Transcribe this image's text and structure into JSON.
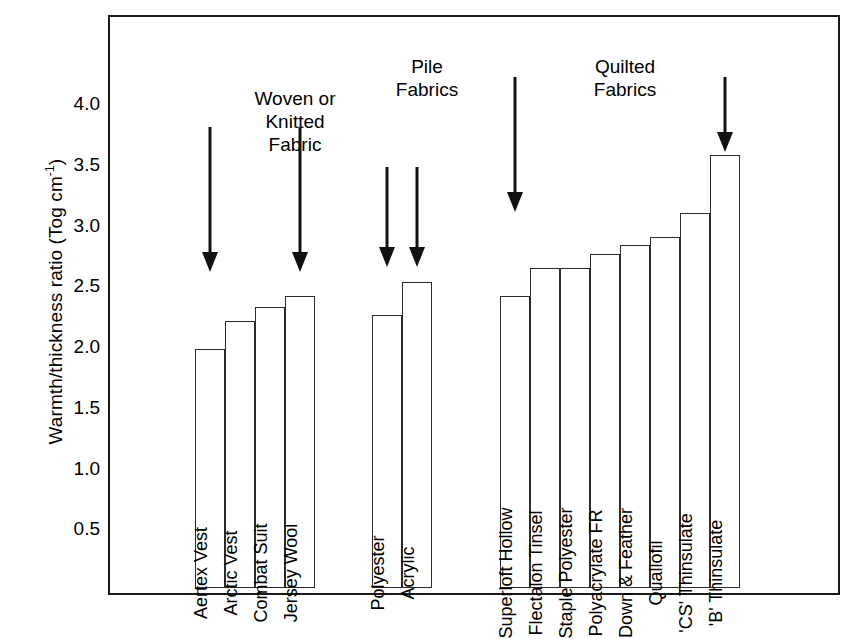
{
  "chart_data": {
    "type": "bar",
    "title": "",
    "xlabel": "",
    "ylabel": "Warmth/thickness ratio (Tog cm",
    "ylabel_sup": "-1",
    "ylabel_tail": ")",
    "ylim": [
      0,
      4.25
    ],
    "grid": false,
    "legend": "none",
    "ticks": [
      "4.0",
      "3.5",
      "3.0",
      "2.5",
      "2.0",
      "1.5",
      "1.0",
      "0.5"
    ],
    "tick_values": [
      4.0,
      3.5,
      3.0,
      2.5,
      2.0,
      1.5,
      1.0,
      0.5
    ],
    "categories": [
      "Aertex Vest",
      "Arctic Vest",
      "Combat Suit",
      "Jersey Wool",
      "Polyester",
      "Acrylic",
      "Superloft Hollow",
      "Flectalon Tinsel",
      "Staple Polyester",
      "Polyacrylate FR",
      "Down & Feather",
      "Quallofil",
      "'CS' Thinsulate",
      "'B' Thinsulate"
    ],
    "values": [
      1.97,
      2.2,
      2.31,
      2.4,
      2.25,
      2.52,
      2.4,
      2.63,
      2.63,
      2.75,
      2.82,
      2.89,
      3.09,
      3.56
    ],
    "groups": [
      {
        "name": "woven-knitted",
        "title": "Woven or\nKnitted\nFabric",
        "bars": [
          {
            "label": "Aertex Vest",
            "value": 1.97
          },
          {
            "label": "Arctic Vest",
            "value": 2.2
          },
          {
            "label": "Combat Suit",
            "value": 2.31
          },
          {
            "label": "Jersey Wool",
            "value": 2.4
          }
        ]
      },
      {
        "name": "pile-fabrics",
        "title": "Pile\nFabrics",
        "bars": [
          {
            "label": "Polyester",
            "value": 2.25
          },
          {
            "label": "Acrylic",
            "value": 2.52
          }
        ]
      },
      {
        "name": "quilted-fabrics",
        "title": "Quilted\nFabrics",
        "bars": [
          {
            "label": "Superloft Hollow",
            "value": 2.4
          },
          {
            "label": "Flectalon Tinsel",
            "value": 2.63
          },
          {
            "label": "Staple Polyester",
            "value": 2.63
          },
          {
            "label": "Polyacrylate FR",
            "value": 2.75
          },
          {
            "label": "Down & Feather",
            "value": 2.82
          },
          {
            "label": "Quallofil",
            "value": 2.89
          },
          {
            "label": "'CS' Thinsulate",
            "value": 3.09
          },
          {
            "label": "'B' Thinsulate",
            "value": 3.56
          }
        ]
      }
    ],
    "annotations": [
      {
        "type": "arrow",
        "points_to": "Aertex Vest"
      },
      {
        "type": "arrow",
        "points_to": "Jersey Wool"
      },
      {
        "type": "arrow",
        "points_to": "Polyester"
      },
      {
        "type": "arrow",
        "points_to": "Acrylic"
      },
      {
        "type": "arrow",
        "points_to": "Superloft Hollow"
      },
      {
        "type": "arrow",
        "points_to": "'B' Thinsulate"
      }
    ],
    "colors": {
      "bar_fill": "#ffffff",
      "bar_stroke": "#2b2b2b",
      "frame": "#1a1a1a",
      "text": "#000000",
      "background": "#ffffff"
    }
  }
}
